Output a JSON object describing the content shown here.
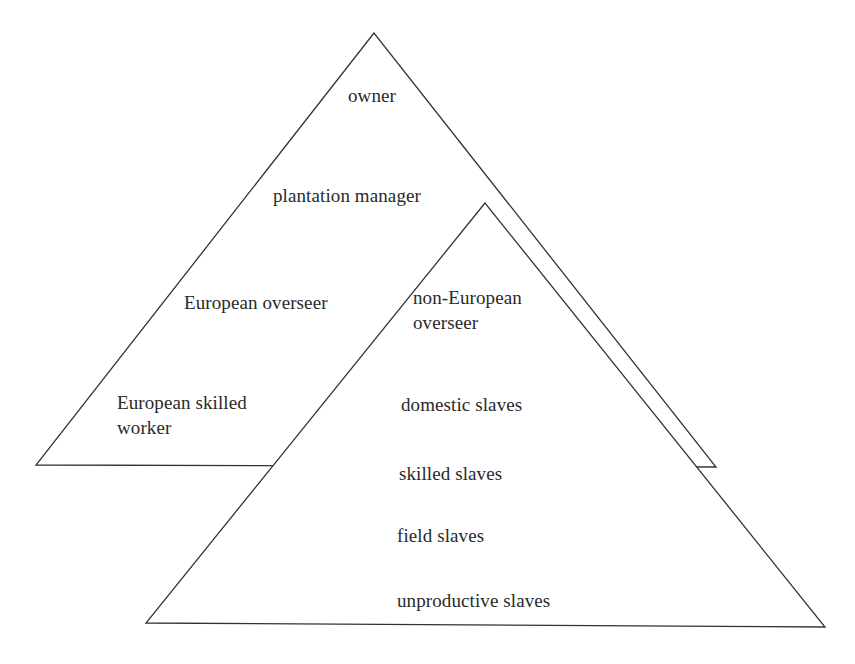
{
  "diagram": {
    "type": "overlapping-pyramids",
    "line_color": "#333333",
    "background": "#ffffff",
    "back_pyramid": {
      "name": "European hierarchy",
      "levels": [
        {
          "id": "owner",
          "label": "owner"
        },
        {
          "id": "plantation-manager",
          "label": "plantation manager"
        },
        {
          "id": "european-overseer",
          "label": "European overseer"
        },
        {
          "id": "european-skilled-worker",
          "label": "European skilled\nworker"
        }
      ]
    },
    "front_pyramid": {
      "name": "Slave hierarchy",
      "levels": [
        {
          "id": "non-european-overseer",
          "label": "non-European\noverseer"
        },
        {
          "id": "domestic-slaves",
          "label": "domestic slaves"
        },
        {
          "id": "skilled-slaves",
          "label": "skilled slaves"
        },
        {
          "id": "field-slaves",
          "label": "field slaves"
        },
        {
          "id": "unproductive-slaves",
          "label": "unproductive slaves"
        }
      ]
    }
  }
}
